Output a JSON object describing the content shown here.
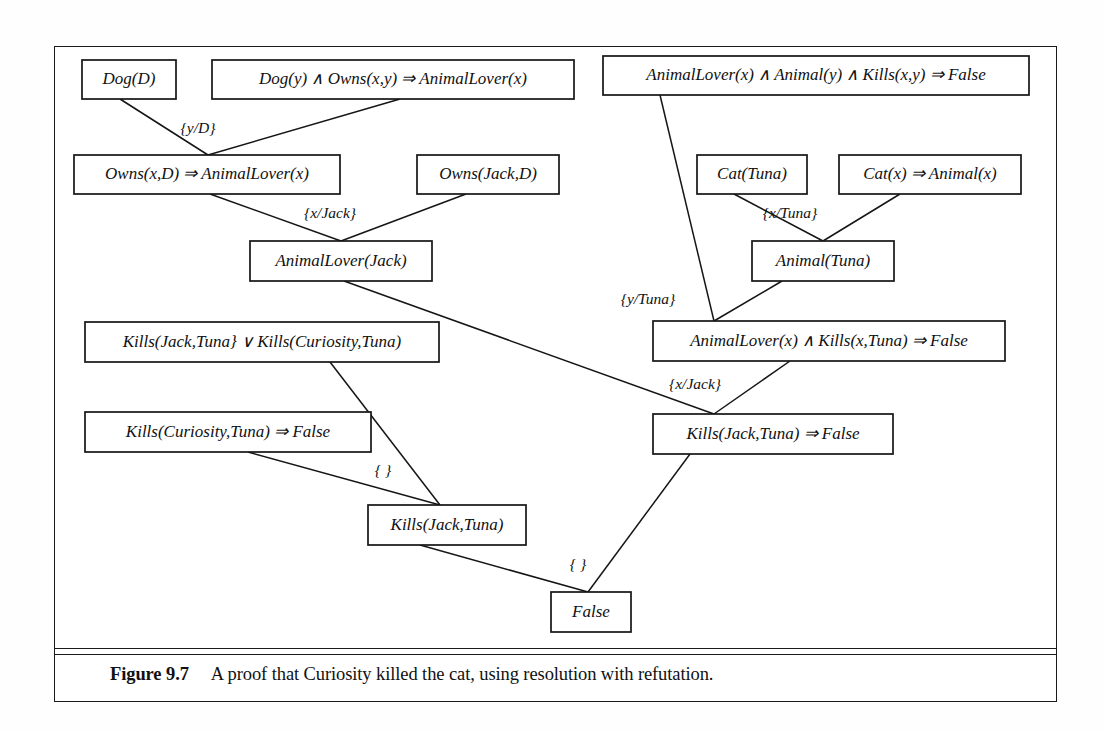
{
  "figure": {
    "caption_label": "Figure 9.7",
    "caption_text": "A proof that Curiosity killed the cat, using resolution with refutation."
  },
  "diagram": {
    "type": "resolution-proof-tree",
    "colors": {
      "line": "#151515",
      "box_fill": "#ffffff",
      "text": "#111111",
      "background": "#ffffff"
    },
    "nodes": [
      {
        "id": "dog_d",
        "label": "Dog(D)",
        "x": 82,
        "y": 60,
        "w": 94,
        "h": 39
      },
      {
        "id": "dog_owns_rule",
        "label": "Dog(y)  ∧  Owns(x,y)  ⇒  AnimalLover(x)",
        "x": 212,
        "y": 60,
        "w": 362,
        "h": 39
      },
      {
        "id": "al_animal_kills",
        "label": "AnimalLover(x)  ∧  Animal(y)  ∧  Kills(x,y)  ⇒  False",
        "x": 603,
        "y": 56,
        "w": 426,
        "h": 39
      },
      {
        "id": "owns_x_d",
        "label": "Owns(x,D)  ⇒  AnimalLover(x)",
        "x": 74,
        "y": 155,
        "w": 266,
        "h": 39
      },
      {
        "id": "owns_jack_d",
        "label": "Owns(Jack,D)",
        "x": 417,
        "y": 155,
        "w": 142,
        "h": 39
      },
      {
        "id": "cat_tuna",
        "label": "Cat(Tuna)",
        "x": 697,
        "y": 155,
        "w": 110,
        "h": 39
      },
      {
        "id": "cat_animal_rule",
        "label": "Cat(x)  ⇒  Animal(x)",
        "x": 839,
        "y": 155,
        "w": 182,
        "h": 39
      },
      {
        "id": "al_jack",
        "label": "AnimalLover(Jack)",
        "x": 250,
        "y": 241,
        "w": 182,
        "h": 40
      },
      {
        "id": "animal_tuna",
        "label": "Animal(Tuna)",
        "x": 752,
        "y": 241,
        "w": 142,
        "h": 40
      },
      {
        "id": "kills_or",
        "label": "Kills(Jack,Tuna}  ∨ Kills(Curiosity,Tuna)",
        "x": 85,
        "y": 322,
        "w": 354,
        "h": 40
      },
      {
        "id": "al_kills_tuna",
        "label": "AnimalLover(x)  ∧ Kills(x,Tuna)  ⇒  False",
        "x": 653,
        "y": 321,
        "w": 352,
        "h": 40
      },
      {
        "id": "kills_cur_false",
        "label": "Kills(Curiosity,Tuna)  ⇒  False",
        "x": 85,
        "y": 412,
        "w": 286,
        "h": 40
      },
      {
        "id": "kills_jack_false",
        "label": "Kills(Jack,Tuna)  ⇒  False",
        "x": 653,
        "y": 414,
        "w": 240,
        "h": 40
      },
      {
        "id": "kills_jack",
        "label": "Kills(Jack,Tuna)",
        "x": 368,
        "y": 505,
        "w": 158,
        "h": 40
      },
      {
        "id": "false_node",
        "label": "False",
        "x": 551,
        "y": 592,
        "w": 80,
        "h": 40
      }
    ],
    "edges": [
      {
        "from": "dog_d",
        "to": "owns_x_d",
        "x1": 120,
        "y1": 99,
        "x2": 208,
        "y2": 155
      },
      {
        "from": "dog_owns_rule",
        "to": "owns_x_d",
        "x1": 400,
        "y1": 99,
        "x2": 208,
        "y2": 155
      },
      {
        "from": "owns_x_d",
        "to": "al_jack",
        "x1": 210,
        "y1": 194,
        "x2": 341,
        "y2": 241
      },
      {
        "from": "owns_jack_d",
        "to": "al_jack",
        "x1": 466,
        "y1": 194,
        "x2": 341,
        "y2": 241
      },
      {
        "from": "al_animal_kills",
        "to": "al_kills_tuna",
        "x1": 660,
        "y1": 95,
        "x2": 714,
        "y2": 321
      },
      {
        "from": "cat_tuna",
        "to": "animal_tuna",
        "x1": 734,
        "y1": 194,
        "x2": 823,
        "y2": 241
      },
      {
        "from": "cat_animal_rule",
        "to": "animal_tuna",
        "x1": 900,
        "y1": 194,
        "x2": 823,
        "y2": 241
      },
      {
        "from": "animal_tuna",
        "to": "al_kills_tuna",
        "x1": 782,
        "y1": 281,
        "x2": 714,
        "y2": 321
      },
      {
        "from": "al_jack",
        "to": "kills_jack_false",
        "x1": 344,
        "y1": 281,
        "x2": 714,
        "y2": 414
      },
      {
        "from": "al_kills_tuna",
        "to": "kills_jack_false",
        "x1": 790,
        "y1": 361,
        "x2": 714,
        "y2": 414
      },
      {
        "from": "kills_or",
        "to": "kills_jack",
        "x1": 330,
        "y1": 362,
        "x2": 440,
        "y2": 505
      },
      {
        "from": "kills_cur_false",
        "to": "kills_jack",
        "x1": 248,
        "y1": 452,
        "x2": 440,
        "y2": 505
      },
      {
        "from": "kills_jack",
        "to": "false_node",
        "x1": 420,
        "y1": 545,
        "x2": 588,
        "y2": 592
      },
      {
        "from": "kills_jack_false",
        "to": "false_node",
        "x1": 690,
        "y1": 454,
        "x2": 588,
        "y2": 592
      }
    ],
    "substitutions": [
      {
        "id": "subst_y_d",
        "label": "{y/D}",
        "x": 198,
        "y": 129
      },
      {
        "id": "subst_x_jack",
        "label": "{x/Jack}",
        "x": 330,
        "y": 214
      },
      {
        "id": "subst_x_tuna",
        "label": "{x/Tuna}",
        "x": 790,
        "y": 214
      },
      {
        "id": "subst_y_tuna",
        "label": "{y/Tuna}",
        "x": 648,
        "y": 300
      },
      {
        "id": "subst_x_jack2",
        "label": "{x/Jack}",
        "x": 695,
        "y": 385
      },
      {
        "id": "subst_empty_1",
        "label": "{ }",
        "x": 383,
        "y": 471
      },
      {
        "id": "subst_empty_2",
        "label": "{ }",
        "x": 578,
        "y": 565
      }
    ]
  }
}
